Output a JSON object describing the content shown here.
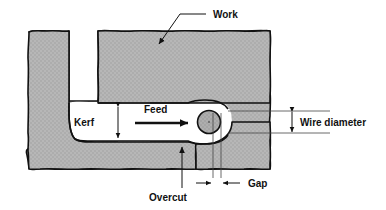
{
  "figure": {
    "type": "technical-diagram",
    "background_color": "#ffffff",
    "outline_color": "#111111",
    "material_fill_color": "#b5b5b5",
    "wire_fill_color": "#a8a8a8"
  },
  "labels": {
    "work": "Work",
    "kerf": "Kerf",
    "feed": "Feed",
    "wire_diameter": "Wire diameter",
    "overcut": "Overcut",
    "gap": "Gap"
  },
  "annotations": [
    {
      "name": "work",
      "text": "Work",
      "text_x": 213,
      "text_y": 14,
      "leader": "M 206 14 L 178 14 L 158 44",
      "arrow_at": [
        158,
        48
      ],
      "arrow_dir": "down-left",
      "style": "leader-arrow"
    },
    {
      "name": "kerf",
      "text": "Kerf",
      "text_x": 84,
      "text_y": 122,
      "dimension": "vertical-double-arrow",
      "dim_x": 118,
      "dim_y_top": 104,
      "dim_y_bottom": 142
    },
    {
      "name": "feed",
      "text": "Feed",
      "text_x": 144,
      "text_y": 113,
      "dimension": "horizontal-arrow-right",
      "arrow_x_start": 135,
      "arrow_x_end": 192,
      "arrow_y": 123
    },
    {
      "name": "wire-diameter",
      "text": "Wire diameter",
      "text_x": 303,
      "text_y": 122,
      "dimension": "vertical-double-arrow",
      "dim_x": 292,
      "dim_y_top": 111,
      "dim_y_bottom": 133
    },
    {
      "name": "overcut",
      "text": "Overcut",
      "text_x": 168,
      "text_y": 196,
      "leader": "M 182 189 L 182 146",
      "arrow_at": [
        182,
        142
      ],
      "arrow_dir": "up",
      "style": "leader-arrow"
    },
    {
      "name": "gap",
      "text": "Gap",
      "text_x": 258,
      "text_y": 183,
      "dimension": "horizontal-inward-arrows",
      "line_left_x": 213,
      "line_right_x": 221,
      "arrow_y": 183
    }
  ],
  "geometry": {
    "wire": {
      "cx": 209,
      "cy": 122,
      "r": 11.5
    },
    "kerf_top_y": 103,
    "kerf_bottom_y": 142,
    "work_right_edge_x": 270,
    "work_left_edge_x": 27
  }
}
